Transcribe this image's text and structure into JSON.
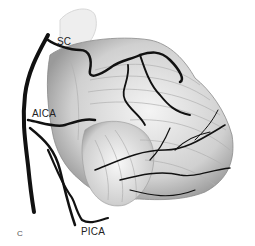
{
  "figure": {
    "panel_label": "C",
    "labels": {
      "sc": "SC",
      "aica": "AICA",
      "pica": "PICA"
    },
    "colors": {
      "background": "#ffffff",
      "artery": "#111111",
      "tissue_light": "#e6e6e6",
      "tissue_mid": "#bdbdbd",
      "tissue_dark": "#8a8a8a"
    }
  }
}
